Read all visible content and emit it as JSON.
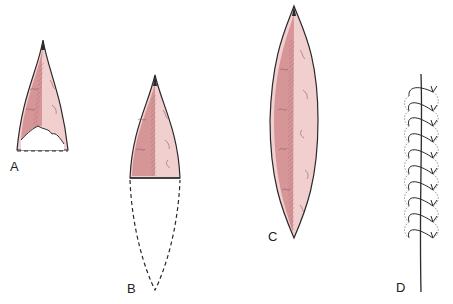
{
  "figure": {
    "panels": [
      {
        "id": "A",
        "label": "A"
      },
      {
        "id": "B",
        "label": "B"
      },
      {
        "id": "C",
        "label": "C"
      },
      {
        "id": "D",
        "label": "D"
      }
    ],
    "colors": {
      "outline": "#2a2a2a",
      "tissue_dark": "#c98a8e",
      "tissue_mid": "#dda4a6",
      "tissue_light": "#f2cfcf",
      "vein": "#8a5a5e"
    },
    "d_stitch_count": 10
  }
}
